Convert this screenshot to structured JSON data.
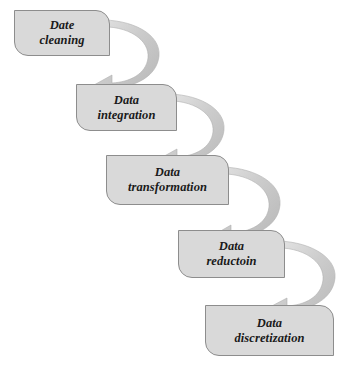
{
  "diagram": {
    "type": "cascade-flow",
    "background_color": "#ffffff",
    "box_fill_color": "#d9d9d9",
    "box_border_color": "#8d8d8d",
    "arrow_fill_color": "#c9c9c9",
    "text_color": "#1a1a1a",
    "stages": [
      {
        "id": "data-cleaning",
        "label": "Date\ncleaning",
        "line1": "Date",
        "line2": "cleaning",
        "x": 14,
        "y": 10,
        "width": 96,
        "height": 46
      },
      {
        "id": "data-integration",
        "label": "Data\nintegration",
        "line1": "Data",
        "line2": "integration",
        "x": 76,
        "y": 84,
        "width": 101,
        "height": 47
      },
      {
        "id": "data-transformation",
        "label": "Data\ntransformation",
        "line1": "Data",
        "line2": "transformation",
        "x": 106,
        "y": 155,
        "width": 123,
        "height": 50
      },
      {
        "id": "data-reduction",
        "label": "Data\nreductoin",
        "line1": "Data",
        "line2": "reductoin",
        "x": 178,
        "y": 230,
        "width": 107,
        "height": 48
      },
      {
        "id": "data-discretization",
        "label": "Data\ndiscretization",
        "line1": "Data",
        "line2": "discretization",
        "x": 205,
        "y": 305,
        "width": 129,
        "height": 51
      }
    ],
    "connectors": [
      {
        "id": "arrow-cleaning-to-integration",
        "from": "data-cleaning",
        "to": "data-integration"
      },
      {
        "id": "arrow-integration-to-transformation",
        "from": "data-integration",
        "to": "data-transformation"
      },
      {
        "id": "arrow-transformation-to-reduction",
        "from": "data-transformation",
        "to": "data-reduction"
      },
      {
        "id": "arrow-reduction-to-discretization",
        "from": "data-reduction",
        "to": "data-discretization"
      }
    ]
  }
}
